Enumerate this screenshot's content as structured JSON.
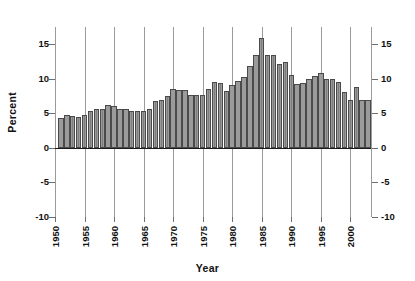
{
  "chart_data": {
    "type": "bar",
    "title": "",
    "subtitle": "",
    "xlabel": "Year",
    "ylabel": "Percent",
    "ylim": [
      -10,
      17.5
    ],
    "xlim": [
      1950,
      2003.5
    ],
    "yticks": [
      15,
      10,
      5,
      0,
      -5,
      -10
    ],
    "ytick_labels": [
      "15",
      "10",
      "5",
      "0",
      "-5",
      "-10"
    ],
    "xticks": [
      1950,
      1955,
      1960,
      1965,
      1970,
      1975,
      1980,
      1985,
      1990,
      1995,
      2000
    ],
    "xtick_labels": [
      "1950",
      "1955",
      "1960",
      "1965",
      "1970",
      "1975",
      "1980",
      "1985",
      "1990",
      "1995",
      "2000"
    ],
    "grid": "vertical-only",
    "legend": "none",
    "dual_y_axis": true,
    "bar_color": "#909090",
    "bar_edge_color": "#4a4a4a",
    "grid_color": "#9a9a9a",
    "axis_color": "#1a1a1a",
    "categories": [
      1951,
      1952,
      1953,
      1954,
      1955,
      1956,
      1957,
      1958,
      1959,
      1960,
      1961,
      1962,
      1963,
      1964,
      1965,
      1966,
      1967,
      1968,
      1969,
      1970,
      1971,
      1972,
      1973,
      1974,
      1975,
      1976,
      1977,
      1978,
      1979,
      1980,
      1981,
      1982,
      1983,
      1984,
      1985,
      1986,
      1987,
      1988,
      1989,
      1990,
      1991,
      1992,
      1993,
      1994,
      1995,
      1996,
      1997,
      1998,
      1999,
      2000,
      2001,
      2002,
      2003
    ],
    "values": [
      4.3,
      4.7,
      4.6,
      4.5,
      4.8,
      5.3,
      5.6,
      5.6,
      6.2,
      6.1,
      5.7,
      5.6,
      5.4,
      5.4,
      5.4,
      5.6,
      6.8,
      6.9,
      7.5,
      8.6,
      8.4,
      8.4,
      7.6,
      7.6,
      7.6,
      8.5,
      9.5,
      9.4,
      8.3,
      9.1,
      9.7,
      10.2,
      11.8,
      13.5,
      15.9,
      13.5,
      13.4,
      12.1,
      12.5,
      10.6,
      9.3,
      9.4,
      10.0,
      10.4,
      10.8,
      10.0,
      10.0,
      9.5,
      8.1,
      7.0,
      8.8,
      7.0,
      7.0
    ],
    "series_name": "Percent",
    "units": "percent",
    "peak": {
      "year": 1985,
      "value": 15.9
    },
    "min": {
      "year": 1951,
      "value": 4.3
    }
  }
}
